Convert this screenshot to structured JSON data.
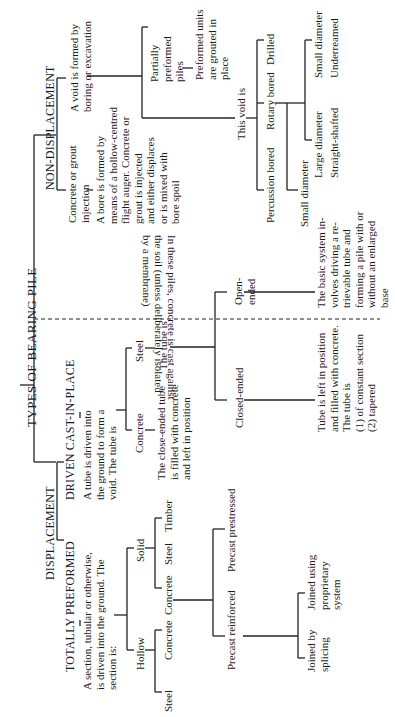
{
  "title": "TYPES OF BEARING PILE",
  "displacement": {
    "label": "DISPLACEMENT",
    "totally_preformed": {
      "label": "TOTALLY PREFORMED",
      "description": "A section, tubular or otherwise,\nis driven into the ground. The\nsection is:",
      "hollow": {
        "label": "Hollow",
        "children": [
          "Steel",
          "Concrete"
        ]
      },
      "solid": {
        "label": "Solid",
        "children": [
          "Concrete",
          "Steel",
          "Timber"
        ]
      },
      "concrete_types": {
        "precast_reinforced": "Precast reinforced",
        "precast_prestressed": "Precast prestressed",
        "joined_by_splicing": "Joined by\nsplicing",
        "joined_proprietary": "Joined using\nproprietary\nsystem"
      }
    },
    "driven_cast_in_place": {
      "label": "DRIVEN CAST-IN-PLACE",
      "description": "A tube is driven into\nthe ground to form a\nvoid. The tube is",
      "concrete": "Concrete",
      "concrete_desc": "The close-ended tube\nis filled with concrete\nand left in position",
      "steel": "Steel",
      "steel_desc": "The tube is",
      "closed_ended": "Closed-ended",
      "closed_desc": "Tube is left in position\nand filled with concrete.\nThe tube is\n(1) of constant section\n(2) tapered",
      "open_ended": "Open-\nended",
      "open_desc": "The basic system in-\nvolves driving a re-\ntrievable tube and\nforming a pile with or\nwithout an enlarged\nbase"
    }
  },
  "divider_note": "In these piles, concrete is cast against\nthe soil (unless deliberately isolated\nby a membrane)",
  "non_displacement": {
    "label": "NON-DISPLACEMENT",
    "grout": {
      "label": "Concrete or grout\ninjection",
      "description": "A bore is formed by\nmeans of a hollow-centred\nflight auger. Concrete or\ngrout is injected\nand either displaces\nor is mixed with\nbore spoil"
    },
    "void": {
      "label": "A void is formed by\nboring or excavation",
      "partially_preformed": "Partially\npreformed\npiles",
      "partially_desc": "Preformed units\nare grouted in\nplace",
      "this_void_is": "This void is",
      "percussion": "Percussion bored",
      "rotary": "Rotary bored",
      "drilled": "Drilled",
      "small_diameter_main": "Small diameter",
      "large_diameter": "Large diameter",
      "straight_shafted": "Straight-shafted",
      "small_diameter": "Small diameter",
      "underreamed": "Underreamed"
    }
  }
}
